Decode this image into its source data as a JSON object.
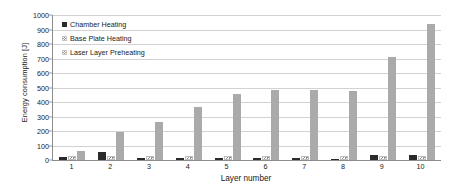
{
  "chart_data": {
    "type": "bar",
    "title": "",
    "xlabel": "Layer number",
    "ylabel": "Energy consumption [J]",
    "categories": [
      "1",
      "2",
      "3",
      "4",
      "5",
      "6",
      "7",
      "8",
      "9",
      "10"
    ],
    "ylim": [
      0,
      1000
    ],
    "ytick_step": 100,
    "yticks": [
      "0",
      "100",
      "200",
      "300",
      "400",
      "500",
      "600",
      "700",
      "800",
      "900",
      "1000"
    ],
    "grid": true,
    "legend_position": "top-left-inside",
    "series": [
      {
        "name": "Chamber Heating",
        "color": "#2b2b2b",
        "values": [
          24,
          55,
          14,
          14,
          14,
          14,
          14,
          10,
          34,
          34
        ]
      },
      {
        "name": "Base Plate Heating",
        "color": "#8e8e8e",
        "pattern": "diagonal-hatch",
        "values": [
          28,
          28,
          28,
          28,
          28,
          28,
          28,
          28,
          28,
          28
        ]
      },
      {
        "name": "Laser Layer Preheating",
        "color": "#aaaaaa",
        "values": [
          62,
          193,
          262,
          366,
          455,
          483,
          483,
          476,
          710,
          938
        ]
      }
    ]
  },
  "axes": {
    "y_title": "Energy consumption [J]",
    "x_title": "Layer number"
  }
}
